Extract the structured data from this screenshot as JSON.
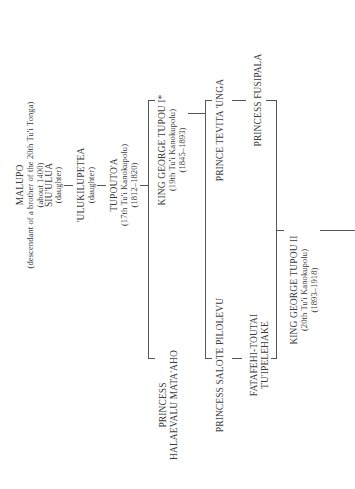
{
  "people": {
    "malupo": {
      "name": "MALUPO",
      "note": "(descendant of a brother of the 20th Tu'i Tonga)",
      "dates": "(about 1400)"
    },
    "siuulua": {
      "name": "SIU'ULUA",
      "note": "(daughter)"
    },
    "ulukilupetea": {
      "name": "'ULUKILUPETEA",
      "note": "(daughter)"
    },
    "tupoutoa": {
      "name": "TUPOUTO'A",
      "title": "(17th Tu'i Kanokupolu)",
      "dates": "(1812–1820)"
    },
    "king_george_tupou_1": {
      "name": "KING GEORGE TUPOU I*",
      "title": "(19th Tu'i Kanokupolu)",
      "dates": "(1845–1893)"
    },
    "princess_halaevalu": {
      "name_line1": "PRINCESS",
      "name_line2": "HALAEVALU MATA'AHO"
    },
    "prince_tevita_unga": {
      "name": "PRINCE TEVITA 'UNGA"
    },
    "princess_fusipala": {
      "name": "PRINCESS FUSIPALA"
    },
    "princess_salote_pilolevu": {
      "name": "PRINCESS SALOTE PILOLEVU"
    },
    "fatafehi": {
      "name_line1": "FATAFEHI-TOUTAI",
      "name_line2": "TU'IPELEHAKE"
    },
    "king_george_tupou_2": {
      "name": "KING GEORGE TUPOU II",
      "title": "(20th Tu'i Kanokupolu)",
      "dates": "(1893–1918)"
    }
  },
  "colors": {
    "text": "#3a3a3a",
    "lines": "#555555",
    "background": "#ffffff"
  },
  "orientation": "rotated 90° counter-clockwise"
}
